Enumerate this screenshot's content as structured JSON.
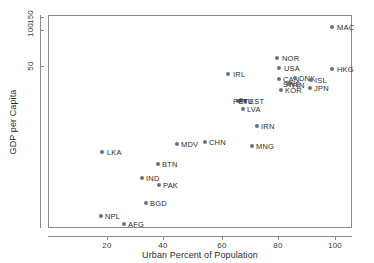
{
  "chart_data": {
    "type": "scatter",
    "title": "",
    "xlabel": "Urban Percent of Population",
    "ylabel": "GDP per Capita",
    "xlim": [
      3,
      109
    ],
    "ylim_log": [
      0.9,
      175
    ],
    "yscale": "log",
    "xscale": "linear",
    "grid": false,
    "legend": "none",
    "xticks": [
      20,
      40,
      60,
      80,
      100
    ],
    "xtick_labels": [
      "20",
      "40",
      "60",
      "80",
      "100"
    ],
    "yticks": [
      50,
      100,
      150
    ],
    "ytick_labels": [
      "50",
      "100",
      "150"
    ],
    "marker_color": "#707070",
    "frame_color": "#8a8a8a",
    "points": [
      {
        "label": "MAC",
        "x": 99.9,
        "y": 120.0,
        "px": 332,
        "py": 27,
        "lx": 337,
        "ly": 27
      },
      {
        "label": "HKG",
        "x": 100.0,
        "y": 52.0,
        "px": 332,
        "py": 69,
        "lx": 337,
        "ly": 69
      },
      {
        "label": "NOR",
        "x": 80.5,
        "y": 62.0,
        "px": 277,
        "py": 58,
        "lx": 282,
        "ly": 58
      },
      {
        "label": "USA",
        "x": 81.3,
        "y": 51.0,
        "px": 279,
        "py": 68,
        "lx": 284,
        "ly": 68
      },
      {
        "label": "CAN",
        "x": 81.4,
        "y": 44.0,
        "px": 279,
        "py": 79,
        "lx": 283,
        "ly": 79
      },
      {
        "label": "DNK",
        "x": 87.0,
        "y": 44.5,
        "px": 295,
        "py": 78,
        "lx": 299,
        "ly": 78
      },
      {
        "label": "ISL",
        "x": 94.0,
        "y": 43.0,
        "px": 311,
        "py": 80,
        "lx": 315,
        "ly": 80
      },
      {
        "label": "SWE",
        "x": 85.3,
        "y": 41.5,
        "px": 290,
        "py": 83,
        "lx": 283,
        "ly": 84
      },
      {
        "label": "FIN",
        "x": 84.5,
        "y": 41.0,
        "px": 288,
        "py": 84,
        "lx": 292,
        "ly": 85
      },
      {
        "label": "KOR",
        "x": 82.0,
        "y": 37.5,
        "px": 281,
        "py": 90,
        "lx": 285,
        "ly": 90
      },
      {
        "label": "JPN",
        "x": 93.5,
        "y": 38.5,
        "px": 310,
        "py": 88,
        "lx": 314,
        "ly": 88
      },
      {
        "label": "IRL",
        "x": 63.0,
        "y": 50.0,
        "px": 228,
        "py": 74,
        "lx": 233,
        "ly": 74
      },
      {
        "label": "EST",
        "x": 68.0,
        "y": 30.0,
        "px": 245,
        "py": 101,
        "lx": 249,
        "ly": 101
      },
      {
        "label": "LTU",
        "x": 67.0,
        "y": 30.5,
        "px": 241,
        "py": 100,
        "lx": 239,
        "ly": 101
      },
      {
        "label": "PRT",
        "x": 66.0,
        "y": 30.2,
        "px": 238,
        "py": 101,
        "lx": 233,
        "ly": 101
      },
      {
        "label": "LVA",
        "x": 67.5,
        "y": 27.5,
        "px": 243,
        "py": 109,
        "lx": 247,
        "ly": 109
      },
      {
        "label": "IRN",
        "x": 72.5,
        "y": 21.5,
        "px": 257,
        "py": 126,
        "lx": 261,
        "ly": 126
      },
      {
        "label": "MNG",
        "x": 71.0,
        "y": 15.0,
        "px": 252,
        "py": 146,
        "lx": 256,
        "ly": 146
      },
      {
        "label": "CHN",
        "x": 54.5,
        "y": 16.0,
        "px": 205,
        "py": 142,
        "lx": 209,
        "ly": 142
      },
      {
        "label": "MDV",
        "x": 44.5,
        "y": 15.5,
        "px": 177,
        "py": 144,
        "lx": 181,
        "ly": 144
      },
      {
        "label": "LKA",
        "x": 18.3,
        "y": 13.0,
        "px": 102,
        "py": 152,
        "lx": 107,
        "ly": 152
      },
      {
        "label": "BTN",
        "x": 37.8,
        "y": 10.5,
        "px": 158,
        "py": 164,
        "lx": 162,
        "ly": 164
      },
      {
        "label": "IND",
        "x": 32.0,
        "y": 8.0,
        "px": 142,
        "py": 178,
        "lx": 146,
        "ly": 178
      },
      {
        "label": "PAK",
        "x": 38.0,
        "y": 7.0,
        "px": 159,
        "py": 185,
        "lx": 163,
        "ly": 185
      },
      {
        "label": "BGD",
        "x": 33.5,
        "y": 4.8,
        "px": 146,
        "py": 203,
        "lx": 150,
        "ly": 203
      },
      {
        "label": "NPL",
        "x": 18.0,
        "y": 3.3,
        "px": 101,
        "py": 216,
        "lx": 105,
        "ly": 216
      },
      {
        "label": "AFG",
        "x": 26.0,
        "y": 2.7,
        "px": 124,
        "py": 224,
        "lx": 128,
        "ly": 224
      }
    ]
  },
  "axes": {
    "x_title": "Urban Percent of Population",
    "y_title": "GDP per Capita",
    "x_ticks": [
      {
        "label": "20",
        "px": 107
      },
      {
        "label": "40",
        "px": 163
      },
      {
        "label": "60",
        "px": 222
      },
      {
        "label": "80",
        "px": 278
      },
      {
        "label": "100",
        "px": 335
      }
    ],
    "y_ticks": [
      {
        "label": "150",
        "py": 17
      },
      {
        "label": "100",
        "py": 30
      },
      {
        "label": "50",
        "py": 66
      }
    ]
  }
}
